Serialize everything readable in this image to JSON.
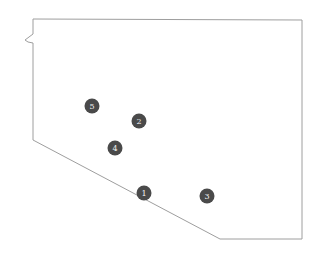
{
  "map": {
    "region_outline": {
      "stroke": "#9e9e9e",
      "fill": "#ffffff",
      "points": "33,19 302,20 302,239 220,239 33,140 33,43 28,42 25,40 33,34 33,19"
    },
    "marker_color": "#4a4a4a",
    "markers": [
      {
        "label": "1",
        "x": 144,
        "y": 193
      },
      {
        "label": "2",
        "x": 139,
        "y": 121
      },
      {
        "label": "3",
        "x": 207,
        "y": 196
      },
      {
        "label": "4",
        "x": 115,
        "y": 148
      },
      {
        "label": "5",
        "x": 92,
        "y": 106
      }
    ]
  }
}
